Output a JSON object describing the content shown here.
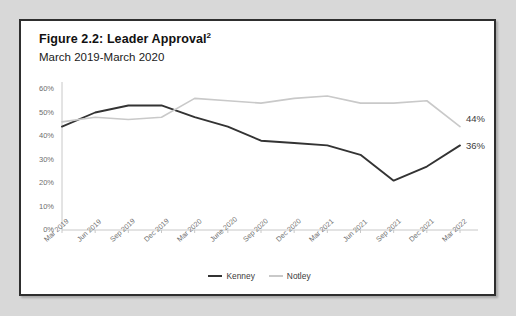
{
  "figure": {
    "title_main": "Figure 2.2: Leader Approval",
    "title_superscript": "2",
    "subtitle": "March 2019-March 2020"
  },
  "colors": {
    "kenney_line": "#333333",
    "notley_line": "#c9c9c9",
    "axis": "#c8c8c8",
    "tick_text": "#6d6d6d",
    "frame_border": "#2e2e2e",
    "page_background": "#d8d8d8",
    "plot_background": "#ffffff"
  },
  "legend": {
    "position": "bottom-center",
    "items": [
      {
        "label": "Kenney",
        "color": "#333333"
      },
      {
        "label": "Notley",
        "color": "#c9c9c9"
      }
    ]
  },
  "endpoint_labels": [
    {
      "series": "Notley",
      "text": "44%"
    },
    {
      "series": "Kenney",
      "text": "36%"
    }
  ],
  "chart_data": {
    "type": "line",
    "title": "Figure 2.2: Leader Approval",
    "subtitle": "March 2019-March 2020",
    "xlabel": "",
    "ylabel": "",
    "ylim": [
      0,
      60
    ],
    "ytick_labels": [
      "0%",
      "10%",
      "20%",
      "30%",
      "40%",
      "50%",
      "60%"
    ],
    "yticks": [
      0,
      10,
      20,
      30,
      40,
      50,
      60
    ],
    "grid": false,
    "legend_position": "bottom-center",
    "categories": [
      "Mar 2019",
      "Jun 2019",
      "Sep 2019",
      "Dec 2019",
      "Mar 2020",
      "June 2020",
      "Sep 2020",
      "Dec 2020",
      "Mar 2021",
      "Jun 2021",
      "Sep 2021",
      "Dec 2021",
      "Mar 2022"
    ],
    "series": [
      {
        "name": "Kenney",
        "color": "#333333",
        "values": [
          44,
          50,
          53,
          53,
          48,
          44,
          38,
          37,
          36,
          32,
          21,
          27,
          36
        ],
        "end_label": "36%"
      },
      {
        "name": "Notley",
        "color": "#c9c9c9",
        "values": [
          46,
          48,
          47,
          48,
          56,
          55,
          54,
          56,
          57,
          54,
          54,
          55,
          44
        ],
        "end_label": "44%"
      }
    ]
  }
}
